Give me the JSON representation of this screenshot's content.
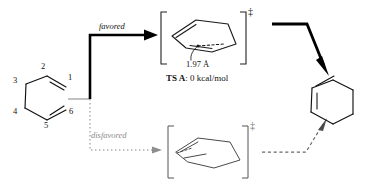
{
  "figure": {
    "type": "reaction-scheme"
  },
  "reactant": {
    "name": "acyclic-triene",
    "atom_labels": [
      "1",
      "2",
      "3",
      "4",
      "5",
      "6"
    ],
    "label_positions": [
      {
        "label": "1",
        "x": 68,
        "y": 78
      },
      {
        "label": "2",
        "x": 41,
        "y": 68
      },
      {
        "label": "3",
        "x": 13,
        "y": 81
      },
      {
        "label": "4",
        "x": 13,
        "y": 112
      },
      {
        "label": "5",
        "x": 44,
        "y": 126
      },
      {
        "label": "6",
        "x": 69,
        "y": 112
      }
    ]
  },
  "pathways": {
    "upper": {
      "label": "favored",
      "label_x": 99,
      "label_y": 22,
      "arrow_style": "solid-bold",
      "color": "#000000"
    },
    "lower": {
      "label": "disfavored",
      "label_x": 91,
      "label_y": 131,
      "arrow_style": "dotted",
      "color": "#9a9a9a"
    }
  },
  "transition_states": {
    "upper": {
      "bracket_left_x": 160,
      "bracket_right_x": 250,
      "dagger": "‡",
      "bond_length_label": "1.97 Å",
      "energy_label_prefix": "TS A",
      "energy_label_sep": ": ",
      "energy_label_value": "0 kcal/mol",
      "geometry": "chair-like"
    },
    "lower": {
      "bracket_left_x": 168,
      "bracket_right_x": 248,
      "dagger": "‡",
      "geometry": "boat-like",
      "color": "#5a5a5a"
    }
  },
  "product": {
    "name": "cyclohexa-1,3-diene",
    "center_x": 330,
    "center_y": 108
  },
  "product_arrows": {
    "from_upper": {
      "style": "solid-bold",
      "color": "#000000"
    },
    "from_lower": {
      "style": "dashed",
      "color": "#6b6b6b"
    }
  },
  "colors": {
    "ink": "#111111",
    "bold_ink": "#000000",
    "gray": "#8a8a8a",
    "light_gray": "#b8b8b8",
    "background": "#ffffff"
  }
}
